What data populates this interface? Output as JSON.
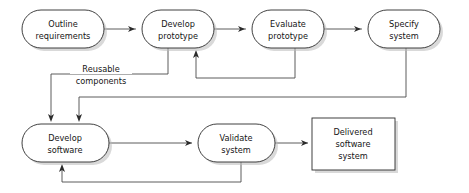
{
  "diagram": {
    "type": "flowchart",
    "canvas": {
      "width": 469,
      "height": 193
    },
    "colors": {
      "background": "#ffffff",
      "node_fill": "#ffffff",
      "node_stroke": "#2b2b2b",
      "node_shadow": "#b9b9b9",
      "line": "#4a4a4a",
      "arrow": "#2b2b2b",
      "text": "#161616"
    },
    "nodes": [
      {
        "id": "outline-requirements",
        "shape": "stadium",
        "lines": [
          "Outline",
          "requirements"
        ],
        "x": 22,
        "y": 10,
        "w": 82,
        "h": 38
      },
      {
        "id": "develop-prototype",
        "shape": "stadium",
        "lines": [
          "Develop",
          "prototype"
        ],
        "x": 142,
        "y": 10,
        "w": 72,
        "h": 38
      },
      {
        "id": "evaluate-prototype",
        "shape": "stadium",
        "lines": [
          "Evaluate",
          "prototype"
        ],
        "x": 252,
        "y": 10,
        "w": 72,
        "h": 38
      },
      {
        "id": "specify-system",
        "shape": "stadium",
        "lines": [
          "Specify",
          "system"
        ],
        "x": 368,
        "y": 10,
        "w": 72,
        "h": 38
      },
      {
        "id": "develop-software",
        "shape": "stadium",
        "lines": [
          "Develop",
          "software"
        ],
        "x": 22,
        "y": 124,
        "w": 87,
        "h": 38
      },
      {
        "id": "validate-system",
        "shape": "stadium",
        "lines": [
          "Validate",
          "system"
        ],
        "x": 198,
        "y": 124,
        "w": 77,
        "h": 38
      },
      {
        "id": "delivered-software-system",
        "shape": "rectangle",
        "lines": [
          "Delivered",
          "software",
          "system"
        ],
        "x": 312,
        "y": 118,
        "w": 83,
        "h": 52
      }
    ],
    "edges": [
      {
        "id": "e1",
        "from": "outline-requirements",
        "to": "develop-prototype",
        "label": ""
      },
      {
        "id": "e2",
        "from": "develop-prototype",
        "to": "evaluate-prototype",
        "label": ""
      },
      {
        "id": "e3",
        "from": "evaluate-prototype",
        "to": "specify-system",
        "label": ""
      },
      {
        "id": "e4",
        "from": "evaluate-prototype",
        "to": "develop-prototype",
        "label": ""
      },
      {
        "id": "e5",
        "from": "develop-prototype",
        "to": "develop-software",
        "label": "Reusable components"
      },
      {
        "id": "e6",
        "from": "specify-system",
        "to": "develop-software",
        "label": ""
      },
      {
        "id": "e7",
        "from": "develop-software",
        "to": "validate-system",
        "label": ""
      },
      {
        "id": "e8",
        "from": "validate-system",
        "to": "delivered-software-system",
        "label": ""
      },
      {
        "id": "e9",
        "from": "validate-system",
        "to": "develop-software",
        "label": ""
      }
    ],
    "edge_labels": [
      {
        "id": "reusable-components",
        "lines": [
          "Reusable",
          "components"
        ],
        "x": 100,
        "y": 74
      }
    ]
  }
}
